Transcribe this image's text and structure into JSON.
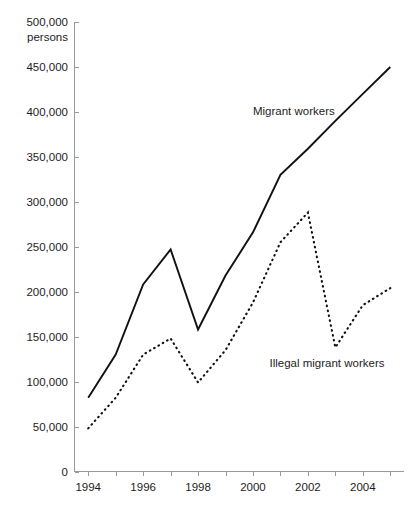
{
  "chart_data": {
    "type": "line",
    "title": "",
    "xlabel": "",
    "ylabel": "500,000 persons",
    "unit_label_line1": "500,000",
    "unit_label_line2": "persons",
    "x": [
      1994,
      1995,
      1996,
      1997,
      1998,
      1999,
      2000,
      2001,
      2002,
      2003,
      2004,
      2005
    ],
    "xlim": [
      1993.5,
      2005.5
    ],
    "ylim": [
      0,
      500000
    ],
    "grid": false,
    "legend_position": "inline-annotation",
    "y_ticks": [
      0,
      50000,
      100000,
      150000,
      200000,
      250000,
      300000,
      350000,
      400000,
      450000,
      500000
    ],
    "y_tick_labels": [
      "0",
      "50,000",
      "100,000",
      "150,000",
      "200,000",
      "250,000",
      "300,000",
      "350,000",
      "400,000",
      "450,000",
      "500,000"
    ],
    "x_ticks": [
      1994,
      1995,
      1996,
      1997,
      1998,
      1999,
      2000,
      2001,
      2002,
      2003,
      2004,
      2005
    ],
    "x_tick_labels": [
      "1994",
      "",
      "1996",
      "",
      "1998",
      "",
      "2000",
      "",
      "2002",
      "",
      "2004",
      ""
    ],
    "x_tick_labels_shown": [
      "1994",
      "1996",
      "1998",
      "2000",
      "2002",
      "2004"
    ],
    "series": [
      {
        "name": "Migrant workers",
        "style": "solid",
        "label_x": 2000.0,
        "label_y": 397000,
        "values": [
          82000,
          130000,
          208000,
          247000,
          158000,
          218000,
          266000,
          330000,
          359000,
          390000,
          420000,
          450000
        ]
      },
      {
        "name": "Illegal migrant workers",
        "style": "dotted",
        "label_x": 2000.6,
        "label_y": 116000,
        "values": [
          48000,
          82000,
          130000,
          148000,
          99000,
          135000,
          188000,
          255000,
          288000,
          138000,
          185000,
          204000
        ]
      }
    ]
  },
  "annotations": {
    "series_1_label": "Migrant workers",
    "series_2_label": "Illegal migrant workers"
  }
}
